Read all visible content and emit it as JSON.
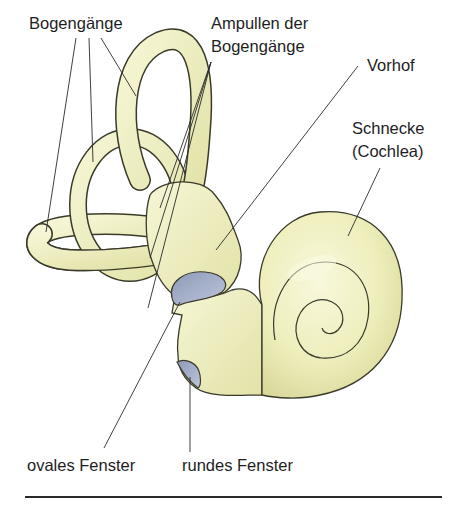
{
  "diagram": {
    "colors": {
      "tissue": "#eeeebc",
      "tissue_shade": "#d8d89a",
      "tissue_highlight": "#f8f8dc",
      "window": "#a9b4cc",
      "window_shade": "#8a96b4",
      "outline": "#3a3a2a",
      "leader": "#2a2a2a",
      "background": "#ffffff"
    },
    "labels": {
      "bogengaenge": "Bogengänge",
      "ampullen_line1": "Ampullen der",
      "ampullen_line2": "Bogengänge",
      "vorhof": "Vorhof",
      "schnecke_line1": "Schnecke",
      "schnecke_line2": "(Cochlea)",
      "ovales_fenster": "ovales Fenster",
      "rundes_fenster": "rundes Fenster"
    },
    "structures": [
      {
        "id": "bogengaenge",
        "name": "Bogengänge",
        "leader_count": 3
      },
      {
        "id": "ampullen",
        "name": "Ampullen der Bogengänge",
        "leader_count": 3
      },
      {
        "id": "vorhof",
        "name": "Vorhof",
        "leader_count": 1
      },
      {
        "id": "schnecke",
        "name": "Schnecke (Cochlea)",
        "leader_count": 1
      },
      {
        "id": "ovales-fenster",
        "name": "ovales Fenster",
        "leader_count": 1
      },
      {
        "id": "rundes-fenster",
        "name": "rundes Fenster",
        "leader_count": 1
      }
    ]
  }
}
